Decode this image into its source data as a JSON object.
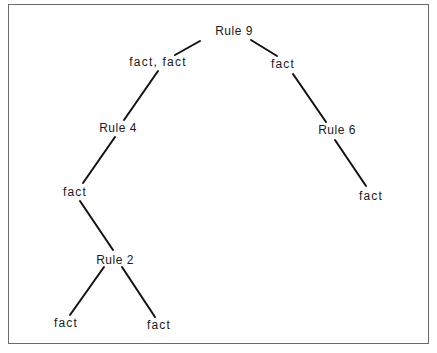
{
  "diagram": {
    "type": "tree",
    "nodes": [
      {
        "id": "rule9",
        "label": "Rule 9",
        "x": 234,
        "y": 31
      },
      {
        "id": "fact_fact",
        "label": "fact,  fact",
        "x": 158,
        "y": 62
      },
      {
        "id": "fact_r",
        "label": "fact",
        "x": 283,
        "y": 64
      },
      {
        "id": "rule4",
        "label": "Rule 4",
        "x": 118,
        "y": 128
      },
      {
        "id": "rule6",
        "label": "Rule 6",
        "x": 337,
        "y": 130
      },
      {
        "id": "fact_l2",
        "label": "fact",
        "x": 75,
        "y": 192
      },
      {
        "id": "fact_r2",
        "label": "fact",
        "x": 371,
        "y": 196
      },
      {
        "id": "rule2",
        "label": "Rule 2",
        "x": 115,
        "y": 260
      },
      {
        "id": "fact_ll",
        "label": "fact",
        "x": 66,
        "y": 323
      },
      {
        "id": "fact_lr",
        "label": "fact",
        "x": 159,
        "y": 325
      }
    ],
    "edges": [
      {
        "from": "rule9",
        "to": "fact_fact",
        "x1": 200,
        "y1": 41,
        "x2": 175,
        "y2": 55
      },
      {
        "from": "rule9",
        "to": "fact_r",
        "x1": 251,
        "y1": 40,
        "x2": 277,
        "y2": 56
      },
      {
        "from": "fact_fact",
        "to": "rule4",
        "x1": 158,
        "y1": 71,
        "x2": 124,
        "y2": 120
      },
      {
        "from": "fact_r",
        "to": "rule6",
        "x1": 293,
        "y1": 74,
        "x2": 326,
        "y2": 122
      },
      {
        "from": "rule4",
        "to": "fact_l2",
        "x1": 115,
        "y1": 137,
        "x2": 83,
        "y2": 183
      },
      {
        "from": "rule6",
        "to": "fact_r2",
        "x1": 335,
        "y1": 140,
        "x2": 366,
        "y2": 186
      },
      {
        "from": "fact_l2",
        "to": "rule2",
        "x1": 80,
        "y1": 201,
        "x2": 113,
        "y2": 250
      },
      {
        "from": "rule2",
        "to": "fact_ll",
        "x1": 104,
        "y1": 267,
        "x2": 70,
        "y2": 315
      },
      {
        "from": "rule2",
        "to": "fact_lr",
        "x1": 122,
        "y1": 267,
        "x2": 155,
        "y2": 317
      }
    ]
  }
}
